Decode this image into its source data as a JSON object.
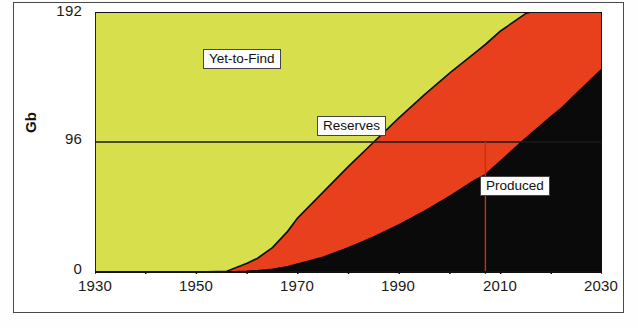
{
  "chart_data": {
    "type": "area",
    "title": "",
    "subtitle": "",
    "xlabel": "",
    "ylabel": "Gb",
    "xlim": [
      1930,
      2030
    ],
    "ylim": [
      0,
      192
    ],
    "xticks": [
      1930,
      1940,
      1950,
      1960,
      1970,
      1980,
      1990,
      2000,
      2010,
      2020,
      2030
    ],
    "xtick_labels": [
      "1930",
      "",
      "1950",
      "",
      "1970",
      "",
      "1990",
      "",
      "2010",
      "",
      "2030"
    ],
    "yticks": [
      0,
      96,
      192
    ],
    "ytick_labels": [
      "0",
      "96",
      "192"
    ],
    "grid": false,
    "legend_position": "in-plot-callouts",
    "stacked": true,
    "stack_order": [
      "Produced",
      "Reserves",
      "Yet-to-Find"
    ],
    "total_label": "Total Ultimate Recovery",
    "total_value": 192,
    "x": [
      1930,
      1940,
      1950,
      1956,
      1960,
      1962,
      1965,
      1968,
      1970,
      1975,
      1980,
      1985,
      1990,
      1995,
      2000,
      2005,
      2007,
      2010,
      2015,
      2020,
      2022,
      2025,
      2030
    ],
    "series": [
      {
        "name": "Produced",
        "color": "#0a0a0a",
        "values": [
          0,
          0,
          0,
          0,
          0.5,
          1,
          2,
          4,
          6,
          11,
          18,
          26,
          35,
          45,
          56,
          68,
          72,
          82,
          99,
          115,
          121,
          132,
          150
        ]
      },
      {
        "name": "Reserves",
        "color": "#e8401c",
        "values": [
          0,
          0,
          0,
          0.5,
          6,
          9,
          16,
          26,
          34,
          48,
          60,
          70,
          79,
          86,
          91,
          94,
          96,
          96,
          92,
          81,
          76,
          62,
          42
        ]
      },
      {
        "name": "Yet-to-Find",
        "color": "#d7e04c",
        "values": [
          192,
          192,
          192,
          191.5,
          185.5,
          182,
          174,
          162,
          152,
          133,
          114,
          96,
          78,
          61,
          45,
          30,
          24,
          14,
          1,
          0,
          0,
          0,
          0
        ]
      }
    ],
    "annotations": [
      {
        "name": "yet-to-find-label",
        "text": "Yet-to-Find",
        "x": 1958,
        "y": 160
      },
      {
        "name": "reserves-label",
        "text": "Reserves",
        "x": 1992,
        "y": 110
      },
      {
        "name": "produced-label",
        "text": "Produced",
        "x": 2017,
        "y": 62
      }
    ],
    "reference_lines": [
      {
        "name": "midpoint-horizontal-line",
        "orientation": "horizontal",
        "value": 96,
        "color": "#1a1a1a"
      },
      {
        "name": "midpoint-vertical-line",
        "orientation": "vertical",
        "value": 2007,
        "color": "#c0321a"
      }
    ]
  },
  "axes": {
    "y_label": "Gb",
    "y_ticks": [
      "192",
      "96",
      "0"
    ],
    "x_ticks": [
      "1930",
      "1950",
      "1970",
      "1990",
      "2010",
      "2030"
    ]
  },
  "labels": {
    "yet_to_find": "Yet-to-Find",
    "reserves": "Reserves",
    "produced": "Produced"
  },
  "colors": {
    "yet_to_find": "#d7e04c",
    "reserves": "#e8401c",
    "produced": "#0a0a0a",
    "axis": "#1a1a1a",
    "marker_line": "#c0321a",
    "frame": "#4a4a4a"
  }
}
